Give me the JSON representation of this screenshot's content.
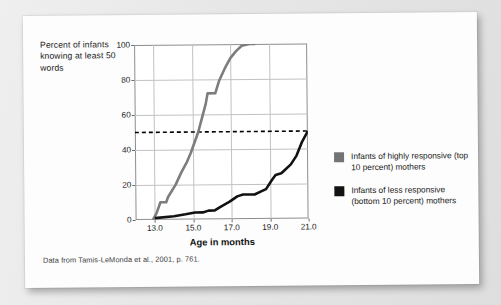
{
  "figure": {
    "y_axis_caption": "Percent of infants knowing at least 50 words",
    "x_axis_title": "Age in months",
    "caption": "Data from Tamis-LeMonda et al., 2001, p. 761."
  },
  "legend": {
    "items": [
      {
        "label": "Infants of highly responsive (top 10 percent) mothers",
        "color": "#747474",
        "swatch_name": "legend-swatch-gray"
      },
      {
        "label": "Infants of less responsive (bottom 10 percent) mothers",
        "color": "#121212",
        "swatch_name": "legend-swatch-black"
      }
    ]
  },
  "colors": {
    "high_responsive_line": "#7d7d7d",
    "low_responsive_line": "#121212",
    "threshold_line": "#000000",
    "gridline": "#c2c2c2",
    "frame": "#8e8e8e",
    "card_background": "#fdfdfd",
    "page_background": "#e9e9e9"
  },
  "chart_data": {
    "type": "line",
    "title": "",
    "xlabel": "Age in months",
    "ylabel": "Percent of infants knowing at least 50 words",
    "xlim": [
      12.0,
      21.0
    ],
    "ylim": [
      0,
      100
    ],
    "xticks": [
      "13.0",
      "15.0",
      "17.0",
      "19.0",
      "21.0"
    ],
    "xtick_values": [
      13.0,
      15.0,
      17.0,
      19.0,
      21.0
    ],
    "yticks": [
      "0",
      "20",
      "40",
      "60",
      "80",
      "100"
    ],
    "ytick_values": [
      0,
      20,
      40,
      60,
      80,
      100
    ],
    "grid": true,
    "legend_position": "right",
    "annotations": [
      {
        "type": "hline",
        "label": "50 percent reference line",
        "y": 50,
        "style": "dashed",
        "color": "#000000"
      }
    ],
    "series": [
      {
        "name": "Infants of highly responsive (top 10 percent) mothers",
        "color": "#7d7d7d",
        "points": [
          [
            12.9,
            0
          ],
          [
            13.1,
            4
          ],
          [
            13.3,
            10
          ],
          [
            13.6,
            10
          ],
          [
            13.7,
            13
          ],
          [
            14.1,
            20
          ],
          [
            14.4,
            27
          ],
          [
            14.7,
            33
          ],
          [
            14.9,
            38
          ],
          [
            15.1,
            44
          ],
          [
            15.3,
            50
          ],
          [
            15.5,
            58
          ],
          [
            15.7,
            66
          ],
          [
            15.8,
            72
          ],
          [
            16.2,
            72
          ],
          [
            16.4,
            79
          ],
          [
            16.7,
            86
          ],
          [
            17.0,
            92
          ],
          [
            17.3,
            96
          ],
          [
            17.6,
            99
          ],
          [
            18.0,
            100
          ],
          [
            18.3,
            100
          ]
        ]
      },
      {
        "name": "Infants of less responsive (bottom 10 percent) mothers",
        "color": "#121212",
        "points": [
          [
            13.0,
            1
          ],
          [
            14.0,
            2
          ],
          [
            14.6,
            3
          ],
          [
            15.1,
            4
          ],
          [
            15.5,
            4
          ],
          [
            15.8,
            5
          ],
          [
            16.1,
            5
          ],
          [
            16.4,
            7
          ],
          [
            16.9,
            10
          ],
          [
            17.3,
            13
          ],
          [
            17.6,
            14
          ],
          [
            18.2,
            14
          ],
          [
            18.6,
            16
          ],
          [
            18.8,
            17
          ],
          [
            19.1,
            22
          ],
          [
            19.3,
            25
          ],
          [
            19.6,
            26
          ],
          [
            19.8,
            28
          ],
          [
            20.1,
            31
          ],
          [
            20.4,
            36
          ],
          [
            20.7,
            44
          ],
          [
            21.0,
            50
          ]
        ]
      }
    ]
  }
}
